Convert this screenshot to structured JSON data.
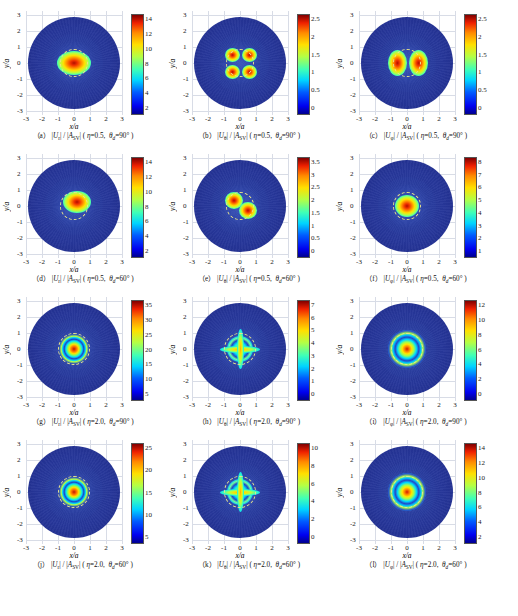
{
  "axes": {
    "xlabel": "x/a",
    "ylabel": "y/a",
    "xticks": [
      "-3",
      "-2",
      "-1",
      "0",
      "1",
      "2",
      "3"
    ],
    "yticks": [
      "3",
      "2",
      "1",
      "0",
      "-1",
      "-2",
      "-3"
    ],
    "xlim": [
      -3,
      3
    ],
    "ylim": [
      -3,
      3
    ]
  },
  "colormap": "jet",
  "panels": [
    {
      "id": "a",
      "label": "(a)",
      "component": "r",
      "numerator": "|U_r|",
      "denominator": "|A_SV|",
      "eta": "0.5",
      "theta_d": "90",
      "cbar_ticks": [
        "14",
        "12",
        "10",
        "8",
        "6",
        "4",
        "2"
      ],
      "cbar_min": 2,
      "cbar_max": 14,
      "pattern": "single-lobe-wide"
    },
    {
      "id": "b",
      "label": "(b)",
      "component": "theta",
      "numerator": "|U_θ|",
      "denominator": "|A_SV|",
      "eta": "0.5",
      "theta_d": "90",
      "cbar_ticks": [
        "2.5",
        "2",
        "1.5",
        "1",
        "0.5",
        "0"
      ],
      "cbar_min": 0,
      "cbar_max": 2.5,
      "pattern": "quadrupole"
    },
    {
      "id": "c",
      "label": "(c)",
      "component": "phi",
      "numerator": "|U_φ|",
      "denominator": "|A_SV|",
      "eta": "0.5",
      "theta_d": "90",
      "cbar_ticks": [
        "2.5",
        "2",
        "1.5",
        "1",
        "0.5",
        "0"
      ],
      "cbar_min": 0,
      "cbar_max": 2.5,
      "pattern": "dipole-horizontal"
    },
    {
      "id": "d",
      "label": "(d)",
      "component": "r",
      "numerator": "|U_r|",
      "denominator": "|A_SV|",
      "eta": "0.5",
      "theta_d": "60",
      "cbar_ticks": [
        "14",
        "12",
        "10",
        "8",
        "6",
        "4",
        "2"
      ],
      "cbar_min": 2,
      "cbar_max": 14,
      "pattern": "single-lobe-offset"
    },
    {
      "id": "e",
      "label": "(e)",
      "component": "theta",
      "numerator": "|U_θ|",
      "denominator": "|A_SV|",
      "eta": "0.5",
      "theta_d": "60",
      "cbar_ticks": [
        "3.5",
        "3",
        "2.5",
        "2",
        "1.5",
        "1",
        "0.5",
        "0"
      ],
      "cbar_min": 0,
      "cbar_max": 3.5,
      "pattern": "twin-lobe-tilted"
    },
    {
      "id": "f",
      "label": "(f)",
      "component": "phi",
      "numerator": "|U_φ|",
      "denominator": "|A_SV|",
      "eta": "0.5",
      "theta_d": "60",
      "cbar_ticks": [
        "8",
        "7",
        "6",
        "5",
        "4",
        "3",
        "2",
        "1"
      ],
      "cbar_min": 1,
      "cbar_max": 8,
      "pattern": "single-lobe-compact"
    },
    {
      "id": "g",
      "label": "(g)",
      "component": "r",
      "numerator": "|U_r|",
      "denominator": "|A_SV|",
      "eta": "2.0",
      "theta_d": "90",
      "cbar_ticks": [
        "35",
        "30",
        "25",
        "20",
        "15",
        "10",
        "5"
      ],
      "cbar_min": 5,
      "cbar_max": 35,
      "pattern": "rings-concentric"
    },
    {
      "id": "h",
      "label": "(h)",
      "component": "theta",
      "numerator": "|U_θ|",
      "denominator": "|A_SV|",
      "eta": "2.0",
      "theta_d": "90",
      "cbar_ticks": [
        "7",
        "6",
        "5",
        "4",
        "3",
        "2",
        "1",
        "0"
      ],
      "cbar_min": 0,
      "cbar_max": 7,
      "pattern": "rings-cross"
    },
    {
      "id": "i",
      "label": "(i)",
      "component": "phi",
      "numerator": "|U_φ|",
      "denominator": "|A_SV|",
      "eta": "2.0",
      "theta_d": "90",
      "cbar_ticks": [
        "12",
        "10",
        "8",
        "6",
        "4",
        "2",
        "0"
      ],
      "cbar_min": 0,
      "cbar_max": 12,
      "pattern": "rings-wide"
    },
    {
      "id": "j",
      "label": "(j)",
      "component": "r",
      "numerator": "|U_r|",
      "denominator": "|A_SV|",
      "eta": "2.0",
      "theta_d": "60",
      "cbar_ticks": [
        "25",
        "20",
        "15",
        "10",
        "5"
      ],
      "cbar_min": 5,
      "cbar_max": 25,
      "pattern": "rings-concentric"
    },
    {
      "id": "k",
      "label": "(k)",
      "component": "theta",
      "numerator": "|U_θ|",
      "denominator": "|A_SV|",
      "eta": "2.0",
      "theta_d": "60",
      "cbar_ticks": [
        "10",
        "8",
        "6",
        "4",
        "2",
        "0"
      ],
      "cbar_min": 0,
      "cbar_max": 10,
      "pattern": "rings-cross"
    },
    {
      "id": "l",
      "label": "(l)",
      "component": "phi",
      "numerator": "|U_φ|",
      "denominator": "|A_SV|",
      "eta": "2.0",
      "theta_d": "60",
      "cbar_ticks": [
        "14",
        "12",
        "10",
        "8",
        "6",
        "4",
        "2"
      ],
      "cbar_min": 2,
      "cbar_max": 14,
      "pattern": "rings-wide"
    }
  ],
  "chart_data": {
    "type": "heatmap",
    "title": "",
    "xlabel": "x/a",
    "ylabel": "y/a",
    "grid": true,
    "legend_position": "right-colorbar",
    "n_panels": 12,
    "panel_grid": [
      4,
      3
    ],
    "domain": "circular disc of radius 3 in x/a, y/a",
    "colormap": "jet",
    "shared_axis_range": {
      "x": [
        -3,
        3
      ],
      "y": [
        -3,
        3
      ]
    },
    "series": [
      {
        "name": "(a) |U_r|/|A_SV|, eta=0.5, theta_d=90",
        "zrange": [
          2,
          14
        ],
        "features": "single central elliptical hot lobe, peak ~14 at origin, dashed yellow contour ring at r~0.75"
      },
      {
        "name": "(b) |U_theta|/|A_SV|, eta=0.5, theta_d=90",
        "zrange": [
          0,
          2.5
        ],
        "features": "four-lobe quadrupole, peaks ~2.5 at (+/-0.4,+/-0.4), nodal lines along x=0 and y=0"
      },
      {
        "name": "(c) |U_phi|/|A_SV|, eta=0.5, theta_d=90",
        "zrange": [
          0,
          2.5
        ],
        "features": "two horizontal lobes peaking ~2.7 at (+/-0.5,0), nodal line at x=0"
      },
      {
        "name": "(d) |U_r|/|A_SV|, eta=0.5, theta_d=60",
        "zrange": [
          2,
          14
        ],
        "features": "single hot lobe shifted to upper-right of origin, peak ~14"
      },
      {
        "name": "(e) |U_theta|/|A_SV|, eta=0.5, theta_d=60",
        "zrange": [
          0,
          3.5
        ],
        "features": "two tilted lobes, peak ~3.5, dashed ring r~0.8"
      },
      {
        "name": "(f) |U_phi|/|A_SV|, eta=0.5, theta_d=60",
        "zrange": [
          1,
          8
        ],
        "features": "compact central lobe, peak ~8, dashed ring r~0.8"
      },
      {
        "name": "(g) |U_r|/|A_SV|, eta=2.0, theta_d=90",
        "zrange": [
          5,
          35
        ],
        "features": "concentric interference rings within r<1, peak ~35 at centre"
      },
      {
        "name": "(h) |U_theta|/|A_SV|, eta=2.0, theta_d=90",
        "zrange": [
          0,
          7
        ],
        "features": "cross-shaped multi-lobe interference, peak ~7"
      },
      {
        "name": "(i) |U_phi|/|A_SV|, eta=2.0, theta_d=90",
        "zrange": [
          0,
          12
        ],
        "features": "wide concentric ring structure, peak ~12"
      },
      {
        "name": "(j) |U_r|/|A_SV|, eta=2.0, theta_d=60",
        "zrange": [
          5,
          25
        ],
        "features": "concentric rings, peak ~25"
      },
      {
        "name": "(k) |U_theta|/|A_SV|, eta=2.0, theta_d=60",
        "zrange": [
          0,
          10
        ],
        "features": "cross-shaped interference lobes, peak ~10"
      },
      {
        "name": "(l) |U_phi|/|A_SV|, eta=2.0, theta_d=60",
        "zrange": [
          2,
          14
        ],
        "features": "wide concentric rings, peak ~14"
      }
    ]
  }
}
